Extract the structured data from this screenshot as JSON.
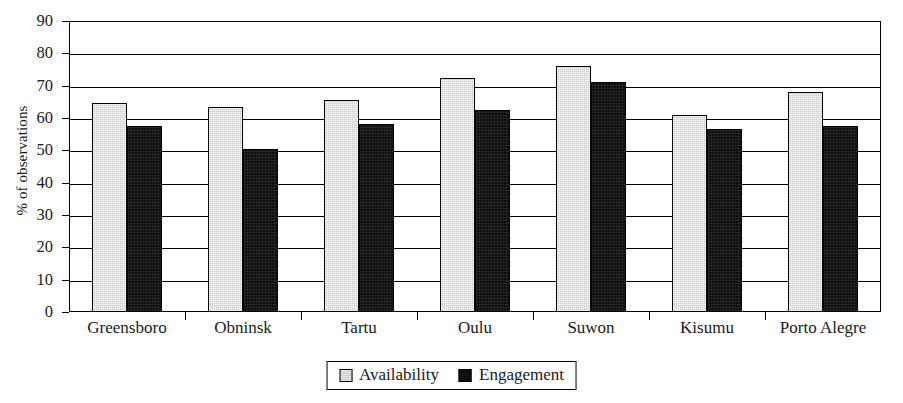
{
  "chart_data": {
    "type": "bar",
    "title": "",
    "xlabel": "",
    "ylabel": "% of observations",
    "ylim": [
      0,
      90
    ],
    "yticks": [
      0,
      10,
      20,
      30,
      40,
      50,
      60,
      70,
      80,
      90
    ],
    "ytick_labels": [
      "0",
      "10",
      "20",
      "30",
      "40",
      "50",
      "60",
      "70",
      "80",
      "90"
    ],
    "grid": "horizontal",
    "legend_position": "bottom-center",
    "categories": [
      "Greensboro",
      "Obninsk",
      "Tartu",
      "Oulu",
      "Suwon",
      "Kisumu",
      "Porto Alegre"
    ],
    "series": [
      {
        "name": "Availability",
        "color": "#cccccc",
        "values": [
          64.5,
          63.5,
          65.5,
          72.5,
          76.0,
          61.0,
          68.0
        ]
      },
      {
        "name": "Engagement",
        "color": "#101010",
        "values": [
          57.5,
          50.5,
          58.0,
          62.5,
          71.0,
          56.5,
          57.5
        ]
      }
    ]
  },
  "legend": {
    "items": [
      {
        "label": "Availability",
        "swatch": "light-gray-square-swatch"
      },
      {
        "label": "Engagement",
        "swatch": "black-square-swatch"
      }
    ]
  }
}
